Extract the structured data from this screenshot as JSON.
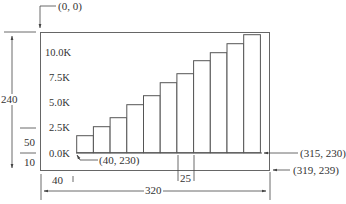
{
  "diagram": {
    "annotations": {
      "origin": "(0, 0)",
      "plot_origin": "(40, 230)",
      "plot_end": "(315, 230)",
      "frame_end": "(319, 239)"
    },
    "dimensions": {
      "height": "240",
      "top_margin_label": "50",
      "bottom_margin_label": "10",
      "left_margin": "40",
      "bar_width": "25",
      "width": "320"
    },
    "stroke_color": "#555555",
    "background": "#ffffff"
  },
  "chart_data": {
    "type": "bar",
    "title": "",
    "xlabel": "",
    "ylabel": "",
    "y_ticks": [
      "0.0K",
      "2.5K",
      "5.0K",
      "7.5K",
      "10.0K"
    ],
    "ylim": [
      0,
      12000
    ],
    "grid": false,
    "categories": [
      "1",
      "2",
      "3",
      "4",
      "5",
      "6",
      "7",
      "8",
      "9",
      "10",
      "11"
    ],
    "values": [
      1700,
      2600,
      3500,
      4800,
      5700,
      7000,
      7900,
      9200,
      10000,
      10900,
      11800
    ]
  }
}
